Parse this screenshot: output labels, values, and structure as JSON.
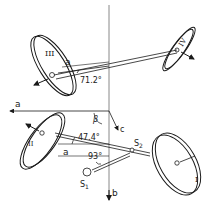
{
  "figure": {
    "type": "geometric-diagram"
  },
  "labels": {
    "disc_I": "I",
    "disc_II": "II",
    "disc_III": "III",
    "disc_IV": "IV",
    "axis_a_top": "a",
    "axis_a_left": "a",
    "axis_a_bottom": "a",
    "axis_b": "b",
    "axis_c": "c",
    "angle_beta": "β",
    "s1": "S",
    "s1_sub": "1",
    "s2": "S",
    "s2_sub": "2"
  },
  "angles": {
    "angle_III_IV": "71.2°",
    "angle_II_I": "47.4°",
    "angle_s1": "93°"
  },
  "colors": {
    "stroke": "#1a1a1a",
    "axis_line": "#888888",
    "background": "#ffffff"
  }
}
